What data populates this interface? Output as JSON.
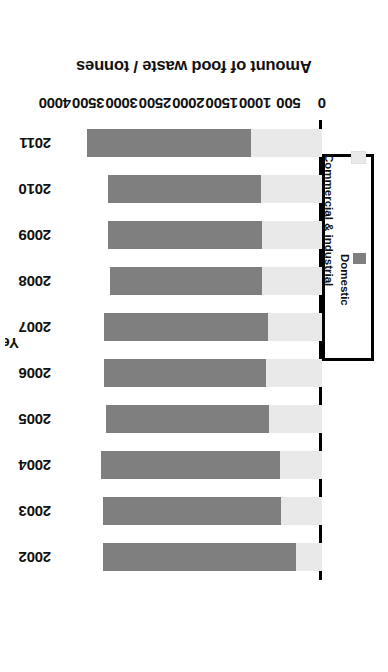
{
  "chart_data": {
    "type": "bar",
    "subtype": "stacked-bar-horizontal-rotated180",
    "title": "",
    "xlabel": "Year",
    "ylabel": "Amount of food waste / tonnes",
    "categories": [
      "2002",
      "2003",
      "2004",
      "2005",
      "2006",
      "2007",
      "2008",
      "2009",
      "2010",
      "2011"
    ],
    "ylim": [
      0,
      4000
    ],
    "yticks": [
      0,
      500,
      1000,
      1500,
      2000,
      2500,
      3000,
      3500,
      4000
    ],
    "ytick_labels": [
      "0",
      "500",
      "1000",
      "1500",
      "2000",
      "2500",
      "3000",
      "3500",
      "4000"
    ],
    "grid": false,
    "legend_position": "left-middle",
    "series": [
      {
        "name": "Commercial & industrial",
        "color": "#e9e9e9",
        "values": [
          390,
          610,
          630,
          790,
          840,
          810,
          900,
          900,
          920,
          1060
        ]
      },
      {
        "name": "Domestic",
        "color": "#7f7f7f",
        "values": [
          2890,
          2670,
          2680,
          2440,
          2430,
          2460,
          2280,
          2310,
          2290,
          2460
        ]
      }
    ],
    "totals": [
      3280,
      3280,
      3310,
      3230,
      3270,
      3270,
      3180,
      3210,
      3210,
      3520
    ]
  },
  "axes": {
    "value_axis_title": "Amount of food waste / tonnes",
    "category_axis_title": "Year"
  },
  "legend": {
    "items": [
      {
        "label": "Domestic",
        "color": "#7f7f7f"
      },
      {
        "label": "Commercial & industrial",
        "color": "#e9e9e9"
      }
    ]
  },
  "colors": {
    "domestic": "#7f7f7f",
    "commercial_industrial": "#e9e9e9",
    "axis": "#000000",
    "background": "#ffffff"
  }
}
